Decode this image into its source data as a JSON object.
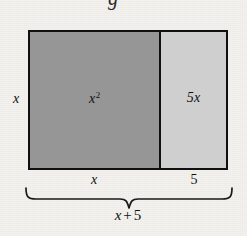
{
  "figure": {
    "type": "area-model-diagram",
    "partial_glyph_above": "g",
    "rectangle": {
      "height_label": "x",
      "regions": [
        {
          "name": "square-region",
          "label_base": "x",
          "label_exponent": "2",
          "width_label": "x",
          "fill": "#969696"
        },
        {
          "name": "strip-region",
          "label_base": "5x",
          "label_exponent": "",
          "width_label": "5",
          "fill": "#cfcfcf"
        }
      ],
      "border_color": "#101010"
    },
    "brace": {
      "total_variable": "x",
      "total_operator": "+",
      "total_constant": "5"
    }
  },
  "colors": {
    "page_background": "#f4f2ee",
    "dark_fill": "#969696",
    "light_fill": "#cfcfcf",
    "ink": "#111111"
  }
}
